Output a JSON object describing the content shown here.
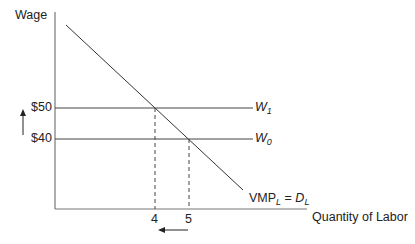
{
  "diagram": {
    "y_axis_label": "Wage",
    "x_axis_label": "Quantity of Labor",
    "wage_high": "$50",
    "wage_low": "$40",
    "line_high_label": {
      "main": "W",
      "sub": "1"
    },
    "line_low_label": {
      "main": "W",
      "sub": "0"
    },
    "demand_label": {
      "vmp": "VMP",
      "vmp_sub": "L",
      "eq": " = ",
      "d": "D",
      "d_sub": "L"
    },
    "q_new": "4",
    "q_old": "5",
    "arrows": {
      "wage": "up",
      "quantity": "left"
    },
    "colors": {
      "line": "#333333",
      "axis": "#666666"
    }
  }
}
